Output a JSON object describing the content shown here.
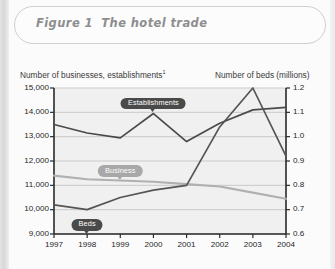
{
  "figure": {
    "number": "Figure 1",
    "title": "The hotel trade"
  },
  "axis_captions": {
    "left": "Number of businesses, establishments",
    "left_superscript": "1",
    "right": "Number of beds (millions)"
  },
  "callouts": {
    "establishments": "Establishments",
    "business": "Business",
    "beds": "Beds"
  },
  "chart_data": {
    "type": "line",
    "title": "The hotel trade",
    "xlabel": "",
    "ylabel": "Number of businesses, establishments",
    "y2label": "Number of beds (millions)",
    "categories": [
      "1997",
      "1998",
      "1999",
      "2000",
      "2001",
      "2002",
      "2003",
      "2004"
    ],
    "ylim": [
      9000,
      15000
    ],
    "yticks": [
      "9,000",
      "10,000",
      "11,000",
      "12,000",
      "13,000",
      "14,000",
      "15,000"
    ],
    "ytick_values": [
      9000,
      10000,
      11000,
      12000,
      13000,
      14000,
      15000
    ],
    "y2lim": [
      0.6,
      1.2
    ],
    "y2ticks": [
      "0.6",
      "0.7",
      "0.8",
      "0.9",
      "1.0",
      "1.1",
      "1.2"
    ],
    "y2tick_values": [
      0.6,
      0.7,
      0.8,
      0.9,
      1.0,
      1.1,
      1.2
    ],
    "grid": true,
    "legend": "callout-labels",
    "series": [
      {
        "name": "Establishments",
        "axis": "left",
        "color": "#4a4a4a",
        "values": [
          13500,
          13150,
          12950,
          13950,
          12800,
          13550,
          14100,
          14200
        ]
      },
      {
        "name": "Business",
        "axis": "left",
        "color": "#b0b0b0",
        "values": [
          11400,
          11250,
          11200,
          11150,
          11050,
          10950,
          10700,
          10450
        ]
      },
      {
        "name": "Beds",
        "axis": "right",
        "color": "#555555",
        "values": [
          0.72,
          0.7,
          0.75,
          0.78,
          0.8,
          1.04,
          1.2,
          0.92
        ]
      }
    ]
  }
}
